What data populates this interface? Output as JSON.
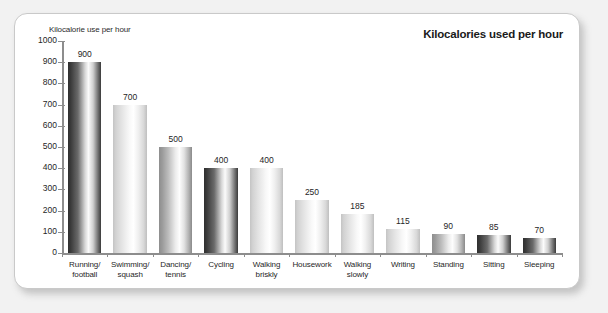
{
  "panel": {
    "title": "Kilocalories used per hour",
    "yaxis_title": "Kilocalorie use per hour"
  },
  "chart_data": {
    "type": "bar",
    "title": "Kilocalories used per hour",
    "xlabel": "",
    "ylabel": "Kilocalorie use per hour",
    "ylim": [
      0,
      1000
    ],
    "yticks": [
      0,
      100,
      200,
      300,
      400,
      500,
      600,
      700,
      800,
      900,
      1000
    ],
    "grid": false,
    "legend": "none",
    "categories": [
      "Running/ football",
      "Swimming/ squash",
      "Dancing/ tennis",
      "Cycling",
      "Walking briskly",
      "Housework",
      "Walking slowly",
      "Writing",
      "Standing",
      "Sitting",
      "Sleeping"
    ],
    "category_lines": [
      [
        "Running/",
        "football"
      ],
      [
        "Swimming/",
        "squash"
      ],
      [
        "Dancing/",
        "tennis"
      ],
      [
        "Cycling"
      ],
      [
        "Walking",
        "briskly"
      ],
      [
        "Housework"
      ],
      [
        "Walking",
        "slowly"
      ],
      [
        "Writing"
      ],
      [
        "Standing"
      ],
      [
        "Sitting"
      ],
      [
        "Sleeping"
      ]
    ],
    "values": [
      900,
      700,
      500,
      400,
      400,
      250,
      185,
      115,
      90,
      85,
      70
    ],
    "bar_tones": [
      "dark",
      "light",
      "mid",
      "dark",
      "light",
      "light",
      "light",
      "light",
      "mid",
      "dark",
      "dark"
    ]
  },
  "colors": {
    "panel_background": "#ffffff",
    "page_background": "#f2f2f2",
    "axis": "#8d8d8d",
    "text": "#1f1f1f",
    "bar_dark": "#2f2f2f",
    "bar_light": "#f2f2f2"
  }
}
